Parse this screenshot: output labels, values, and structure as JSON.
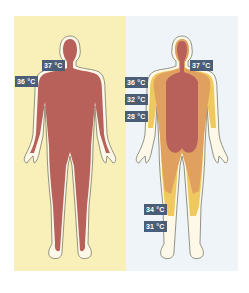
{
  "figure": {
    "type": "thermal body temperature diagram",
    "colors": {
      "warm_background": "#f8f0b8",
      "cold_background": "#eef4f8",
      "core_37": "#b8605a",
      "zone_36_32": "#e0a060",
      "zone_28_31": "#f0c860",
      "skin_outline_fill": "#fdf8e8",
      "outline": "#7a7a6a",
      "label_bg": "#4a5e78",
      "label_text": "#ffffff"
    },
    "panels": [
      {
        "id": "warm",
        "labels": [
          {
            "text": "37 °C"
          },
          {
            "text": "36 °C"
          }
        ]
      },
      {
        "id": "cold",
        "labels": [
          {
            "text": "37 °C"
          },
          {
            "text": "36 °C"
          },
          {
            "text": "32 °C"
          },
          {
            "text": "28 °C"
          },
          {
            "text": "34 °C"
          },
          {
            "text": "31 °C"
          }
        ]
      }
    ],
    "caption": ""
  }
}
